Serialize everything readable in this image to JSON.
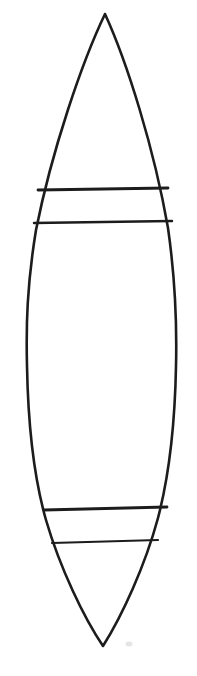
{
  "document": {
    "title": "Surfboard Outline Drawing",
    "kind": "line-drawing",
    "background_color": "#ffffff",
    "width": 197,
    "height": 676,
    "description": "Hand-drawn black outline of an elongated pointed-oval (surfboard / leaf / vesica) shape with four horizontal stripe lines crossing it, two near the top and two near the bottom."
  },
  "drawing": {
    "stroke_color": "#1c1c1c",
    "fill_color": "#ffffff",
    "outline": {
      "name": "board-outline",
      "stroke_width": 2.6,
      "top_tip": {
        "x": 105,
        "y": 14
      },
      "bottom_tip": {
        "x": 103,
        "y": 646
      },
      "widest_left": {
        "x": 27,
        "y": 362
      },
      "widest_right": {
        "x": 182,
        "y": 372
      },
      "path": "M105,14 C82,62 52,150 36,230 C27,285 26,325 27,366 C28,420 34,478 46,520 C60,568 84,618 103,646 C122,616 145,566 158,518 C169,476 175,420 176,366 C177,324 176,284 168,228 C154,148 127,62 105,14 Z"
    },
    "stripes": [
      {
        "name": "stripe-line-top-upper",
        "index": 1,
        "region": "top-band",
        "stroke_width": 2.8,
        "x1": 38,
        "y1": 190,
        "x2": 168,
        "y2": 188
      },
      {
        "name": "stripe-line-top-lower",
        "index": 2,
        "region": "top-band",
        "stroke_width": 2.4,
        "x1": 34,
        "y1": 223,
        "x2": 172,
        "y2": 221
      },
      {
        "name": "stripe-line-bottom-upper",
        "index": 3,
        "region": "bottom-band",
        "stroke_width": 2.8,
        "x1": 44,
        "y1": 510,
        "x2": 167,
        "y2": 507
      },
      {
        "name": "stripe-line-bottom-lower",
        "index": 4,
        "region": "bottom-band",
        "stroke_width": 2.2,
        "x1": 52,
        "y1": 543,
        "x2": 158,
        "y2": 540
      }
    ],
    "smudge": {
      "name": "smudge-mark",
      "x": 129,
      "y": 644,
      "rx": 3.5,
      "ry": 2.5,
      "color": "#cfcfcf"
    }
  }
}
